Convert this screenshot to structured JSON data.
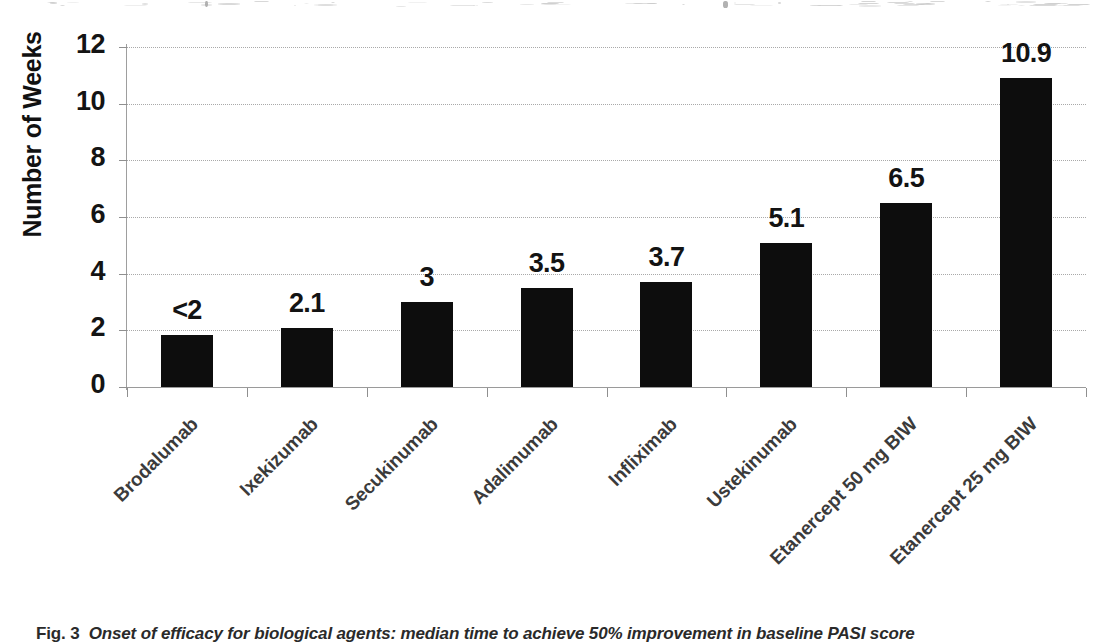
{
  "figure": {
    "caption_label": "Fig. 3",
    "caption_text": "Onset of efficacy for biological agents: median time to achieve 50% improvement in baseline PASI score",
    "caption_full": "Fig. 3  Onset of efficacy for biological agents: median time to achieve 50% improvement in baseline PASI score"
  },
  "colors": {
    "bar": "#0d0d0d",
    "gridline": "#a9a9a9",
    "axis": "#8f8f8f",
    "text": "#141414",
    "category_text": "#3b3b3b",
    "background": "#ffffff"
  },
  "chart_data": {
    "type": "bar",
    "title": "",
    "xlabel": "",
    "ylabel": "Number of Weeks",
    "ylim": [
      0,
      12
    ],
    "ytick_values": [
      0,
      2,
      4,
      6,
      8,
      10,
      12
    ],
    "ytick_labels": [
      "0",
      "2",
      "4",
      "6",
      "8",
      "10",
      "12"
    ],
    "grid": true,
    "grid_axis": "y",
    "grid_style": "dotted",
    "legend": false,
    "legend_position": "none",
    "orientation": "vertical",
    "bar_color": "#0d0d0d",
    "categories": [
      "Brodalumab",
      "Ixekizumab",
      "Secukinumab",
      "Adalimumab",
      "Infliximab",
      "Ustekinumab",
      "Etanercept 50 mg BIW",
      "Etanercept 25 mg BIW"
    ],
    "values": [
      1.85,
      2.1,
      3.0,
      3.5,
      3.7,
      5.1,
      6.5,
      10.9
    ],
    "data_labels": [
      "<2",
      "2.1",
      "3",
      "3.5",
      "3.7",
      "5.1",
      "6.5",
      "10.9"
    ],
    "bars": [
      {
        "category": "Brodalumab",
        "value": 1.85,
        "label": "<2"
      },
      {
        "category": "Ixekizumab",
        "value": 2.1,
        "label": "2.1"
      },
      {
        "category": "Secukinumab",
        "value": 3.0,
        "label": "3"
      },
      {
        "category": "Adalimumab",
        "value": 3.5,
        "label": "3.5"
      },
      {
        "category": "Infliximab",
        "value": 3.7,
        "label": "3.7"
      },
      {
        "category": "Ustekinumab",
        "value": 5.1,
        "label": "5.1"
      },
      {
        "category": "Etanercept 50 mg BIW",
        "value": 6.5,
        "label": "6.5"
      },
      {
        "category": "Etanercept 25 mg BIW",
        "value": 10.9,
        "label": "10.9"
      }
    ]
  }
}
